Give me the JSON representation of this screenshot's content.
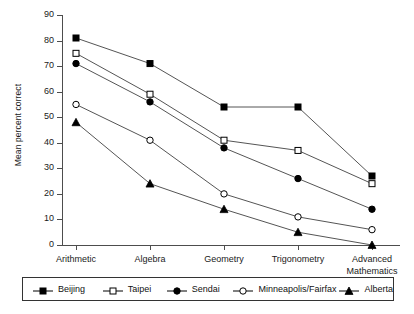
{
  "chart_data": {
    "type": "line",
    "title": "",
    "xlabel": "",
    "ylabel": "Mean percent correct",
    "categories": [
      "Arithmetic",
      "Algebra",
      "Geometry",
      "Trigonometry",
      "Advanced Mathematics"
    ],
    "ylim": [
      0,
      90
    ],
    "yticks": [
      0,
      10,
      20,
      30,
      40,
      50,
      60,
      70,
      80,
      90
    ],
    "grid": false,
    "legend_position": "bottom",
    "series": [
      {
        "name": "Beijing",
        "marker": "filled-square",
        "values": [
          81,
          71,
          54,
          54,
          27
        ]
      },
      {
        "name": "Taipei",
        "marker": "open-square",
        "values": [
          75,
          59,
          41,
          37,
          24
        ]
      },
      {
        "name": "Sendai",
        "marker": "filled-circle",
        "values": [
          71,
          56,
          38,
          26,
          14
        ]
      },
      {
        "name": "Minneapolis/Fairfax",
        "marker": "open-circle",
        "values": [
          55,
          41,
          20,
          11,
          6
        ]
      },
      {
        "name": "Alberta",
        "marker": "filled-triangle",
        "values": [
          48,
          24,
          14,
          5,
          0
        ]
      }
    ]
  },
  "axis": {
    "y_title": "Mean percent correct",
    "y_labels": [
      "90",
      "80",
      "70",
      "60",
      "50",
      "40",
      "30",
      "20",
      "10",
      "0"
    ],
    "x_labels": [
      {
        "line1": "Arithmetic",
        "line2": ""
      },
      {
        "line1": "Algebra",
        "line2": ""
      },
      {
        "line1": "Geometry",
        "line2": ""
      },
      {
        "line1": "Trigonometry",
        "line2": ""
      },
      {
        "line1": "Advanced",
        "line2": "Mathematics"
      }
    ]
  },
  "legend": {
    "items": [
      {
        "label": "Beijing",
        "marker": "filled-square"
      },
      {
        "label": "Taipei",
        "marker": "open-square"
      },
      {
        "label": "Sendai",
        "marker": "filled-circle"
      },
      {
        "label": "Minneapolis/Fairfax",
        "marker": "open-circle"
      },
      {
        "label": "Alberta",
        "marker": "filled-triangle"
      }
    ]
  },
  "colors": {
    "ink": "#000000",
    "axis": "#4d4d4d",
    "series_line": "#555555",
    "background": "#ffffff"
  }
}
